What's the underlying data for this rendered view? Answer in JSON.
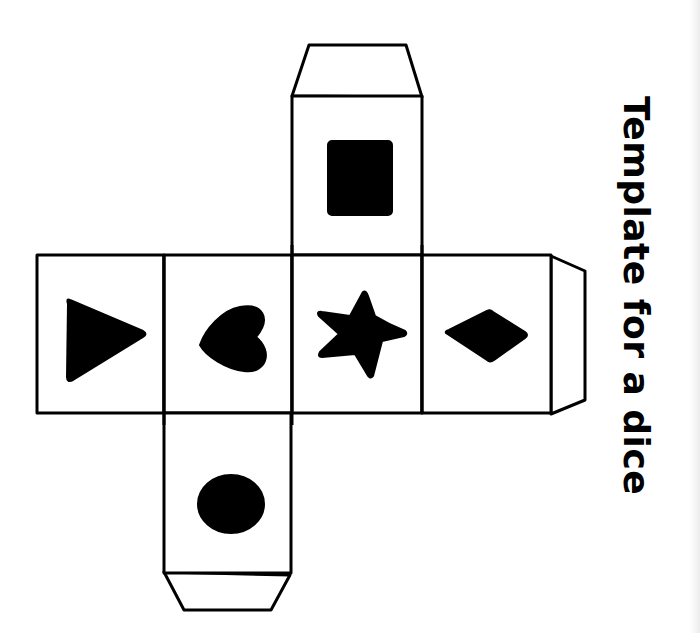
{
  "title": "Template for a dice",
  "colors": {
    "background": "#ffffff",
    "ink": "#000000",
    "edge_strip": "#ececec"
  },
  "net": {
    "faces": [
      {
        "position": "top",
        "symbol": "square-icon"
      },
      {
        "position": "left",
        "symbol": "triangle-icon"
      },
      {
        "position": "center-left",
        "symbol": "heart-icon"
      },
      {
        "position": "center",
        "symbol": "star-icon"
      },
      {
        "position": "center-right",
        "symbol": "diamond-icon"
      },
      {
        "position": "bottom",
        "symbol": "circle-icon"
      }
    ],
    "tabs": [
      "top-tab",
      "right-tab",
      "bottom-tab"
    ]
  }
}
